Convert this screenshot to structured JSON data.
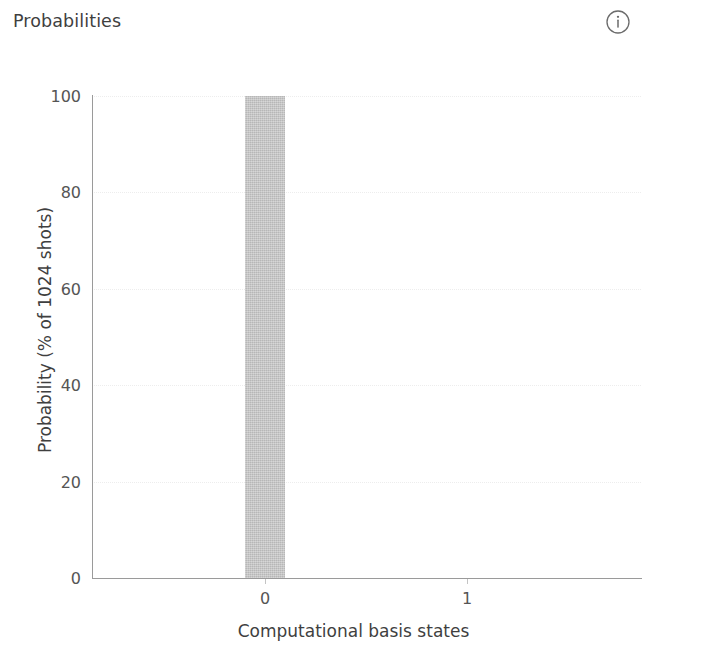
{
  "panel": {
    "title": "Probabilities",
    "info_icon": "info-circle-icon",
    "info_label": "i"
  },
  "chart_data": {
    "type": "bar",
    "title": "",
    "categories": [
      "0",
      "1"
    ],
    "values": [
      100,
      0
    ],
    "series": [
      {
        "name": "Probability",
        "values": [
          100,
          0
        ]
      }
    ],
    "xlabel": "Computational basis states",
    "ylabel": "Probability (% of 1024 shots)",
    "ylim": [
      0,
      100
    ],
    "yticks": [
      0,
      20,
      40,
      60,
      80,
      100
    ],
    "ytick_labels": [
      "0",
      "20",
      "40",
      "60",
      "80",
      "100"
    ],
    "xticks": [
      0,
      1
    ],
    "xtick_labels": [
      "0",
      "1"
    ],
    "grid": true,
    "grid_axis": "y",
    "legend": false,
    "bar_color": "#c9c9c9",
    "axis_color": "#9a9a9a",
    "grid_color": "#ededed",
    "background_color": "#ffffff",
    "shots": 1024
  }
}
